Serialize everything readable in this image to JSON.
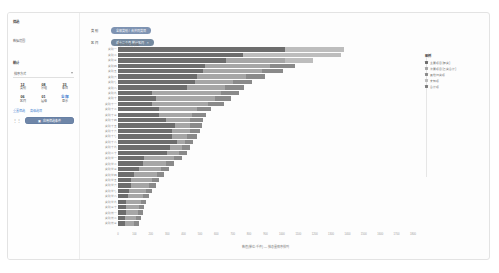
{
  "sidebar": {
    "title": "筛选",
    "subtitle": "数据范围",
    "section": "统计",
    "select": {
      "label": "排序方式",
      "icon": "chevron-down-icon"
    },
    "metrics": [
      {
        "num": "12",
        "label": "类别"
      },
      {
        "num": "08",
        "label": "分组"
      },
      {
        "num": "33",
        "label": "条目"
      },
      {
        "num": "06",
        "label": "区间"
      },
      {
        "num": "01",
        "label": "层级"
      },
      {
        "num": "全部",
        "label": "显示"
      }
    ],
    "links": [
      "重置筛选",
      "高级选项"
    ],
    "button": {
      "label": "应用筛选条件",
      "icon": "filter-icon"
    },
    "dots": "⋮⋮"
  },
  "filters": [
    {
      "label": "类 别",
      "value": "全部类别 / 合并同类项",
      "close": "×"
    },
    {
      "label": "区 间",
      "value": "近十二个月 统计区间",
      "close": "×"
    }
  ],
  "chart_data": {
    "type": "bar",
    "orientation": "horizontal",
    "stacked": true,
    "title": "统计结果分布图",
    "xlabel": "数值(单位:千件) — 按总量降序排列",
    "ylabel": "",
    "xlim": [
      0,
      1800
    ],
    "grid": false,
    "legend_position": "right",
    "legend_title": "图例",
    "xticks": [
      0,
      100,
      200,
      300,
      400,
      500,
      600,
      700,
      800,
      900,
      1000,
      1100,
      1200,
      1300,
      1400,
      1500,
      1600,
      1700,
      1800
    ],
    "series": [
      {
        "name": "主要项目(甲类)",
        "color": "#6d6d6d"
      },
      {
        "name": "次要项目(乙类合计)",
        "color": "#a6a6a6"
      },
      {
        "name": "其他归类项",
        "color": "#8a8a8a"
      },
      {
        "name": "未知项",
        "color": "#bdbdbd"
      },
      {
        "name": "合计项",
        "color": "#7d7d7d"
      }
    ],
    "categories": [
      "类别一",
      "类别二",
      "类别三",
      "类别四",
      "类别五",
      "类别六",
      "类别七",
      "类别八",
      "类别九",
      "类别十",
      "类别十一",
      "类别十二",
      "类别十三",
      "类别十四",
      "类别十五",
      "类别十六",
      "类别十七",
      "类别十八",
      "类别十九",
      "类别二十",
      "类别廿一",
      "类别廿二",
      "类别廿三",
      "类别廿四",
      "类别廿五",
      "类别廿六",
      "类别廿七",
      "类别廿八",
      "类别廿九",
      "类别三十",
      "类别卅一",
      "类别卅二",
      "类别卅三"
    ],
    "rows": [
      {
        "segments": [
          1020,
          0,
          0,
          360,
          0
        ],
        "total": 1380
      },
      {
        "segments": [
          760,
          0,
          0,
          600,
          0
        ],
        "total": 1360
      },
      {
        "segments": [
          660,
          360,
          0,
          170,
          0
        ],
        "total": 1190
      },
      {
        "segments": [
          530,
          400,
          150,
          0,
          0
        ],
        "total": 1080
      },
      {
        "segments": [
          520,
          360,
          130,
          0,
          0
        ],
        "total": 1010
      },
      {
        "segments": [
          480,
          300,
          120,
          0,
          0
        ],
        "total": 900
      },
      {
        "segments": [
          470,
          230,
          120,
          0,
          0
        ],
        "total": 820
      },
      {
        "segments": [
          420,
          230,
          120,
          0,
          0
        ],
        "total": 770
      },
      {
        "segments": [
          210,
          420,
          110,
          0,
          0
        ],
        "total": 740
      },
      {
        "segments": [
          230,
          360,
          100,
          0,
          0
        ],
        "total": 690
      },
      {
        "segments": [
          210,
          340,
          100,
          0,
          0
        ],
        "total": 650
      },
      {
        "segments": [
          250,
          230,
          90,
          0,
          0
        ],
        "total": 570
      },
      {
        "segments": [
          250,
          200,
          90,
          0,
          0
        ],
        "total": 540
      },
      {
        "segments": [
          290,
          150,
          80,
          0,
          0
        ],
        "total": 520
      },
      {
        "segments": [
          350,
          90,
          70,
          0,
          0
        ],
        "total": 510
      },
      {
        "segments": [
          330,
          110,
          60,
          0,
          0
        ],
        "total": 500
      },
      {
        "segments": [
          330,
          90,
          60,
          0,
          0
        ],
        "total": 480
      },
      {
        "segments": [
          360,
          50,
          50,
          0,
          0
        ],
        "total": 460
      },
      {
        "segments": [
          320,
          70,
          50,
          0,
          0
        ],
        "total": 440
      },
      {
        "segments": [
          300,
          70,
          50,
          0,
          0
        ],
        "total": 420
      },
      {
        "segments": [
          160,
          180,
          50,
          0,
          0
        ],
        "total": 390
      },
      {
        "segments": [
          150,
          140,
          50,
          0,
          0
        ],
        "total": 340
      },
      {
        "segments": [
          130,
          130,
          50,
          0,
          0
        ],
        "total": 310
      },
      {
        "segments": [
          100,
          140,
          40,
          0,
          0
        ],
        "total": 280
      },
      {
        "segments": [
          80,
          130,
          40,
          0,
          0
        ],
        "total": 250
      },
      {
        "segments": [
          80,
          110,
          40,
          0,
          0
        ],
        "total": 230
      },
      {
        "segments": [
          70,
          100,
          40,
          0,
          0
        ],
        "total": 210
      },
      {
        "segments": [
          60,
          90,
          40,
          0,
          0
        ],
        "total": 190
      },
      {
        "segments": [
          50,
          90,
          30,
          0,
          0
        ],
        "total": 170
      },
      {
        "segments": [
          50,
          80,
          30,
          0,
          0
        ],
        "total": 160
      },
      {
        "segments": [
          50,
          70,
          30,
          0,
          0
        ],
        "total": 150
      },
      {
        "segments": [
          40,
          70,
          30,
          0,
          0
        ],
        "total": 140
      },
      {
        "segments": [
          40,
          60,
          30,
          0,
          0
        ],
        "total": 130
      }
    ]
  }
}
